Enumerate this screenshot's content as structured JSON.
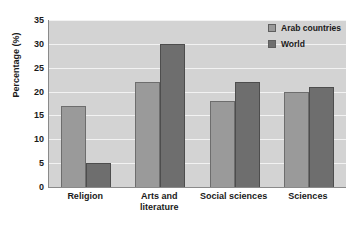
{
  "chart_data": {
    "type": "bar",
    "title": "",
    "subtitle": "",
    "xlabel": "",
    "ylabel": "Percentage (%)",
    "categories": [
      "Religion",
      "Arts and literature",
      "Social sciences",
      "Sciences"
    ],
    "category_lines": [
      [
        "Religion"
      ],
      [
        "Arts and",
        "literature"
      ],
      [
        "Social sciences"
      ],
      [
        "Sciences"
      ]
    ],
    "series": [
      {
        "name": "Arab countries",
        "values": [
          17,
          22,
          18,
          20
        ],
        "color": "#9a9a9a"
      },
      {
        "name": "World",
        "values": [
          5,
          30,
          22,
          21
        ],
        "color": "#6e6e6e"
      }
    ],
    "ylim": [
      0,
      35
    ],
    "yticks": [
      0,
      5,
      10,
      15,
      20,
      25,
      30,
      35
    ],
    "ytick_labels": [
      "0",
      "5",
      "10",
      "15",
      "20",
      "25",
      "30",
      "35"
    ],
    "grid": true,
    "grid_axis": "y",
    "legend_position": "top-right",
    "plot_background": "#d3d3d3",
    "gridline_color": "#f2f2f2",
    "axis_color": "#8a8a8a",
    "page_background": "#ffffff"
  }
}
